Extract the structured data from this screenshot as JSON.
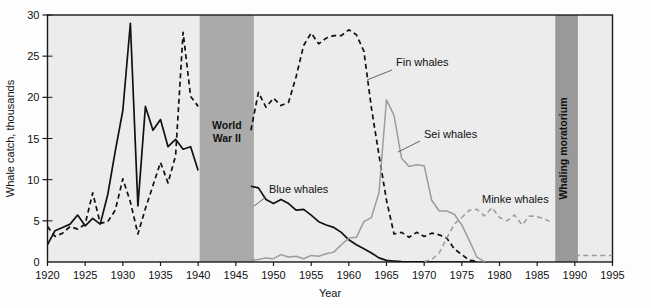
{
  "chart_data": {
    "type": "line",
    "title": "",
    "xlabel": "Year",
    "ylabel": "Whale catch, thousands",
    "xlim": [
      1920,
      1995
    ],
    "ylim": [
      0,
      30
    ],
    "xticks": [
      1920,
      1925,
      1930,
      1935,
      1940,
      1945,
      1950,
      1955,
      1960,
      1965,
      1970,
      1975,
      1980,
      1985,
      1990,
      1995
    ],
    "yticks": [
      0,
      5,
      10,
      15,
      20,
      25,
      30
    ],
    "grid": false,
    "legend_position": "inline-annotations",
    "plot_background": "#ececec",
    "series": [
      {
        "name": "Blue whales",
        "style": "solid",
        "color": "#111111",
        "label_text": "Blue whales",
        "x": [
          1920,
          1921,
          1922,
          1923,
          1924,
          1925,
          1926,
          1927,
          1928,
          1929,
          1930,
          1931,
          1932,
          1933,
          1934,
          1935,
          1936,
          1937,
          1938,
          1939,
          1940,
          1947,
          1948,
          1949,
          1950,
          1951,
          1952,
          1953,
          1954,
          1955,
          1956,
          1957,
          1958,
          1959,
          1960,
          1961,
          1962,
          1963,
          1964,
          1965,
          1966,
          1967,
          1968,
          1969,
          1970,
          1971,
          1972,
          1973,
          1974,
          1975,
          1976,
          1977
        ],
        "y": [
          2.1,
          3.8,
          4.2,
          4.6,
          5.7,
          4.4,
          5.3,
          4.6,
          8.2,
          13.5,
          18.4,
          29.0,
          6.8,
          18.9,
          16.0,
          17.3,
          14.0,
          14.9,
          13.7,
          14.0,
          11.1,
          9.2,
          9.0,
          7.6,
          7.1,
          7.6,
          7.1,
          6.3,
          6.4,
          5.7,
          4.9,
          4.5,
          4.2,
          3.6,
          2.7,
          2.1,
          1.6,
          1.1,
          0.5,
          0.2,
          0.12,
          0.06,
          0.03,
          0.02,
          0.01,
          0.01,
          0.0,
          0.0,
          0.0,
          0.0,
          0.0,
          0.0
        ]
      },
      {
        "name": "Fin whales",
        "style": "dashed",
        "color": "#111111",
        "label_text": "Fin whales",
        "x": [
          1920,
          1921,
          1922,
          1923,
          1924,
          1925,
          1926,
          1927,
          1928,
          1929,
          1930,
          1931,
          1932,
          1933,
          1934,
          1935,
          1936,
          1937,
          1938,
          1939,
          1940,
          1947,
          1948,
          1949,
          1950,
          1951,
          1952,
          1953,
          1954,
          1955,
          1956,
          1957,
          1958,
          1959,
          1960,
          1961,
          1962,
          1963,
          1964,
          1965,
          1966,
          1967,
          1968,
          1969,
          1970,
          1971,
          1972,
          1973,
          1974,
          1975,
          1976,
          1977
        ],
        "y": [
          4.3,
          3.1,
          3.5,
          4.3,
          4.0,
          4.6,
          8.4,
          4.7,
          4.9,
          6.3,
          10.1,
          7.3,
          3.4,
          6.5,
          9.3,
          12.1,
          9.6,
          12.9,
          27.9,
          20.1,
          18.9,
          16.0,
          20.6,
          18.8,
          19.9,
          19.0,
          19.4,
          22.5,
          26.3,
          27.8,
          26.5,
          27.2,
          27.5,
          27.5,
          28.2,
          27.6,
          25.6,
          18.7,
          13.0,
          7.5,
          3.4,
          3.6,
          3.0,
          3.6,
          3.1,
          3.5,
          3.3,
          2.9,
          1.6,
          0.9,
          0.2,
          0.1
        ]
      },
      {
        "name": "Sei whales",
        "style": "solid",
        "color": "#9c9c9c",
        "label_text": "Sei whales",
        "x": [
          1947,
          1948,
          1949,
          1950,
          1951,
          1952,
          1953,
          1954,
          1955,
          1956,
          1957,
          1958,
          1959,
          1960,
          1961,
          1962,
          1963,
          1964,
          1965,
          1966,
          1967,
          1968,
          1969,
          1970,
          1971,
          1972,
          1973,
          1974,
          1975,
          1976,
          1977,
          1978
        ],
        "y": [
          0.2,
          0.3,
          0.5,
          0.4,
          0.9,
          0.6,
          0.7,
          0.4,
          0.8,
          0.7,
          1.0,
          1.2,
          2.1,
          2.9,
          3.0,
          4.9,
          5.4,
          8.4,
          19.7,
          17.8,
          12.6,
          11.6,
          11.8,
          11.7,
          7.5,
          6.2,
          6.2,
          5.8,
          4.5,
          2.6,
          0.6,
          0.05
        ]
      },
      {
        "name": "Minke whales",
        "style": "dashed",
        "color": "#9c9c9c",
        "label_text": "Minke whales",
        "x": [
          1970,
          1971,
          1972,
          1973,
          1974,
          1975,
          1976,
          1977,
          1978,
          1979,
          1980,
          1981,
          1982,
          1983,
          1984,
          1985,
          1986,
          1987,
          1990,
          1991,
          1992,
          1993,
          1994,
          1995
        ],
        "y": [
          0.05,
          0.3,
          1.1,
          2.9,
          4.6,
          5.4,
          6.3,
          6.4,
          5.6,
          6.6,
          5.4,
          5.0,
          5.7,
          4.5,
          5.6,
          5.5,
          5.2,
          4.8,
          0.8,
          0.8,
          0.8,
          0.8,
          0.8,
          0.8
        ]
      }
    ],
    "bands": [
      {
        "name": "World War II",
        "label_lines": [
          "World",
          "War II"
        ],
        "x_start": 1940.2,
        "x_end": 1947.4,
        "color": "#aaaaaa",
        "orientation": "horizontal"
      },
      {
        "name": "Whaling moratorium",
        "label_lines": [
          "Whaling moratorium"
        ],
        "x_start": 1987.4,
        "x_end": 1990.4,
        "color": "#999999",
        "orientation": "vertical"
      }
    ],
    "annotations": [
      {
        "name": "fin-whales-annotation",
        "text": "Fin whales",
        "x_px": 396,
        "y_px": 66,
        "leader": [
          [
            392,
            70
          ],
          [
            367,
            80
          ]
        ]
      },
      {
        "name": "sei-whales-annotation",
        "text": "Sei whales",
        "x_px": 424,
        "y_px": 138,
        "leader": [
          [
            420,
            141
          ],
          [
            398,
            152
          ]
        ]
      },
      {
        "name": "blue-whales-annotation",
        "text": "Blue whales",
        "x_px": 269,
        "y_px": 193,
        "leader": [
          [
            266,
            197
          ],
          [
            254,
            206
          ]
        ]
      },
      {
        "name": "minke-whales-annotation",
        "text": "Minke whales",
        "x_px": 482,
        "y_px": 203,
        "leader": []
      }
    ]
  }
}
